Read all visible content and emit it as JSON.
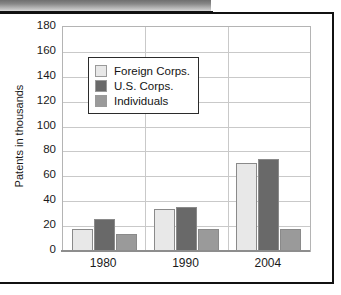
{
  "figure": {
    "banner_label": "decorative-header-band"
  },
  "chart_data": {
    "type": "bar",
    "title": "",
    "xlabel": "",
    "ylabel": "Patents in thousands",
    "categories": [
      "1980",
      "1990",
      "2004"
    ],
    "series": [
      {
        "name": "Foreign Corps.",
        "color": "#e8e8e8",
        "values": [
          18,
          34,
          71
        ]
      },
      {
        "name": "U.S. Corps.",
        "color": "#696969",
        "values": [
          26,
          35,
          74
        ]
      },
      {
        "name": "Individuals",
        "color": "#9a9a9a",
        "values": [
          14,
          18,
          18
        ]
      }
    ],
    "ylim": [
      0,
      180
    ],
    "yticks": [
      180,
      160,
      140,
      120,
      100,
      80,
      60,
      40,
      20,
      0
    ],
    "grid": true,
    "legend_position": "upper-left-inside",
    "bar_border_color": "#8a8a8a",
    "grid_color": "#c9c9c9",
    "axis_color": "#8d8d8d"
  }
}
